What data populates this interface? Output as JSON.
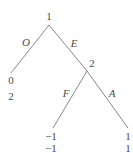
{
  "diagram": {
    "type": "game-tree",
    "nodes": [
      {
        "id": "root",
        "label": "1"
      },
      {
        "id": "n2",
        "label": "2"
      }
    ],
    "edges": [
      {
        "from": "root",
        "to": "leaf_O",
        "label": "O"
      },
      {
        "from": "root",
        "to": "n2",
        "label": "E"
      },
      {
        "from": "n2",
        "to": "leaf_F",
        "label": "F"
      },
      {
        "from": "n2",
        "to": "leaf_A",
        "label": "A"
      }
    ],
    "leaves": [
      {
        "id": "leaf_O",
        "payoff1": "0",
        "payoff2": "2"
      },
      {
        "id": "leaf_F",
        "payoff1": "−1",
        "payoff2": "−1"
      },
      {
        "id": "leaf_A",
        "payoff1": "1",
        "payoff2": "1"
      }
    ]
  }
}
